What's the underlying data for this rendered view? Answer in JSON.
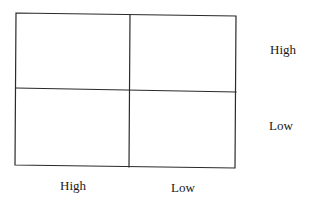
{
  "diagram": {
    "type": "2x2-matrix",
    "row_labels": [
      "High",
      "Low"
    ],
    "column_labels": [
      "High",
      "Low"
    ],
    "cells": [
      {
        "row": "High",
        "column": "High",
        "text": ""
      },
      {
        "row": "High",
        "column": "Low",
        "text": ""
      },
      {
        "row": "Low",
        "column": "High",
        "text": ""
      },
      {
        "row": "Low",
        "column": "Low",
        "text": ""
      }
    ],
    "line_color": "#2a2a2a",
    "background": "#ffffff"
  }
}
